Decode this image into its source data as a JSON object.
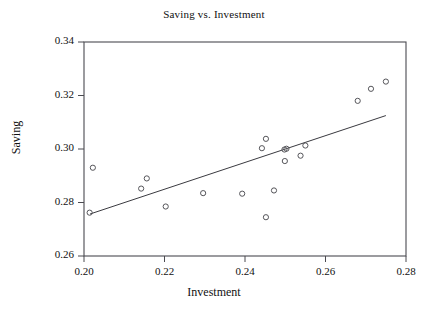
{
  "chart_data": {
    "type": "scatter",
    "title": "Saving vs. Investment",
    "xlabel": "Investment",
    "ylabel": "Saving",
    "xlim": [
      0.2,
      0.28
    ],
    "ylim": [
      0.26,
      0.34
    ],
    "xticks": [
      0.2,
      0.22,
      0.24,
      0.26,
      0.28
    ],
    "yticks": [
      0.26,
      0.28,
      0.3,
      0.32,
      0.34
    ],
    "xtick_labels": [
      "0.20",
      "0.22",
      "0.24",
      "0.26",
      "0.28"
    ],
    "ytick_labels": [
      "0.26",
      "0.28",
      "0.30",
      "0.32",
      "0.34"
    ],
    "grid": false,
    "legend": null,
    "marker": "open-circle",
    "marker_color": "#55555a",
    "line_color": "#3a3a40",
    "points": [
      {
        "x": 0.2022,
        "y": 0.293
      },
      {
        "x": 0.2014,
        "y": 0.2762
      },
      {
        "x": 0.2142,
        "y": 0.2852
      },
      {
        "x": 0.2156,
        "y": 0.289
      },
      {
        "x": 0.2203,
        "y": 0.2785
      },
      {
        "x": 0.2296,
        "y": 0.2835
      },
      {
        "x": 0.2393,
        "y": 0.2833
      },
      {
        "x": 0.2442,
        "y": 0.3003
      },
      {
        "x": 0.2452,
        "y": 0.3038
      },
      {
        "x": 0.2452,
        "y": 0.2745
      },
      {
        "x": 0.2472,
        "y": 0.2845
      },
      {
        "x": 0.2498,
        "y": 0.2998
      },
      {
        "x": 0.2503,
        "y": 0.3001
      },
      {
        "x": 0.2499,
        "y": 0.2955
      },
      {
        "x": 0.2538,
        "y": 0.2975
      },
      {
        "x": 0.255,
        "y": 0.3013
      },
      {
        "x": 0.268,
        "y": 0.318
      },
      {
        "x": 0.2713,
        "y": 0.3225
      },
      {
        "x": 0.275,
        "y": 0.3252
      }
    ],
    "fit_line": {
      "x0": 0.2015,
      "y0": 0.2757,
      "x1": 0.275,
      "y1": 0.3125
    }
  }
}
